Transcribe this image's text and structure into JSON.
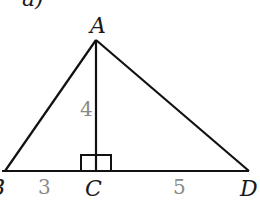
{
  "diagram": {
    "part_label": "a)",
    "vertices": {
      "A": {
        "label": "A",
        "x": 96,
        "y": 40
      },
      "B": {
        "label": "B",
        "x": 5,
        "y": 171
      },
      "C": {
        "label": "C",
        "x": 96,
        "y": 171
      },
      "D": {
        "label": "D",
        "x": 249,
        "y": 171
      }
    },
    "segments": [
      {
        "from": "A",
        "to": "B"
      },
      {
        "from": "A",
        "to": "D"
      },
      {
        "from": "B",
        "to": "D"
      },
      {
        "from": "A",
        "to": "C"
      }
    ],
    "lengths": {
      "AC": "4",
      "BC": "3",
      "CD": "5"
    },
    "right_angle_at": "C",
    "colors": {
      "line": "#111111",
      "vertex_label": "#1a1a1a",
      "length_label": "#8a8a8a"
    }
  }
}
